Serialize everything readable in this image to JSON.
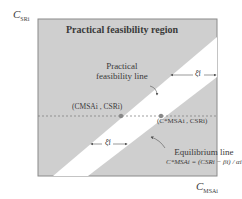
{
  "axes": {
    "y_label": "C",
    "y_sub": "SRi",
    "x_label": "C",
    "x_sub": "MSAi"
  },
  "regions": {
    "title": "Practical feasibility region",
    "fill_color": "#cfcfcf",
    "band_color": "#ffffff"
  },
  "lines": {
    "practical_feasibility_line_1": "Practical",
    "practical_feasibility_line_2": "feasibility line",
    "equilibrium_line_label": "Equilibrium line",
    "equilibrium_formula": "C*MSAi = (CSRi − βi) / αi"
  },
  "points": {
    "point_1": "(CMSAi , CSRi)",
    "point_2": "(C*MSAi , CSRi)"
  },
  "gaps": {
    "xi_upper": "ξ̄i",
    "xi_lower": "ξ̄i"
  }
}
